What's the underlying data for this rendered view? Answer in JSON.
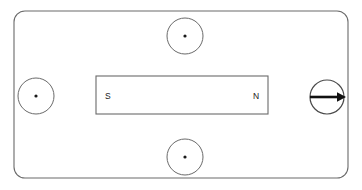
{
  "diagram": {
    "background_color": "#ffffff",
    "stroke_color": "#5a5a5a",
    "ink_color": "#1a1a1a",
    "boundary": {
      "name": "outer-rounded-rectangle",
      "x": 14,
      "y": 11,
      "width": 334,
      "height": 167,
      "corner_radius": 11,
      "stroke_width": 1
    },
    "magnet": {
      "name": "bar-magnet",
      "x": 96,
      "y": 76,
      "width": 172,
      "height": 38,
      "stroke_width": 1,
      "south_label": "S",
      "north_label": "N",
      "south_label_x": 105,
      "north_label_x": 253,
      "label_y": 99
    },
    "field_markers": [
      {
        "name": "field-marker-top",
        "symbol": "dot",
        "meaning": "out-of-page",
        "cx": 185,
        "cy": 36,
        "r": 18
      },
      {
        "name": "field-marker-left",
        "symbol": "dot",
        "meaning": "out-of-page",
        "cx": 36,
        "cy": 96,
        "r": 18
      },
      {
        "name": "field-marker-bottom",
        "symbol": "dot",
        "meaning": "out-of-page",
        "cx": 185,
        "cy": 157,
        "r": 18
      },
      {
        "name": "field-marker-right",
        "symbol": "arrow-right",
        "meaning": "in-plane-pointing-right",
        "cx": 327,
        "cy": 97,
        "r": 17
      }
    ],
    "dot_radius": 1.6,
    "arrow": {
      "x_start": 310,
      "x_end": 346,
      "y": 97,
      "shaft_width": 2.4,
      "head_length": 9,
      "head_half_height": 4.5
    }
  }
}
